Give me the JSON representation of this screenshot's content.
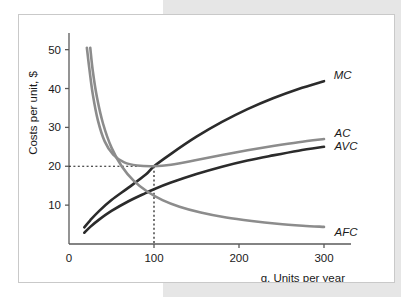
{
  "figure": {
    "background_color": "#ffffff",
    "panel_color": "#e6e6e6",
    "border_color": "#c9c9c9"
  },
  "chart_data": {
    "type": "line",
    "title": "",
    "xlabel": "q, Units per year",
    "ylabel": "Costs per unit, $",
    "xlim": [
      0,
      320
    ],
    "ylim": [
      0,
      53
    ],
    "xticks": [
      0,
      100,
      200,
      300
    ],
    "xtick_labels": [
      "0",
      "100",
      "200",
      "300"
    ],
    "yticks": [
      10,
      20,
      30,
      40,
      50
    ],
    "ytick_labels": [
      "10",
      "20",
      "30",
      "40",
      "50"
    ],
    "grid": false,
    "legend_position": "right-inline-labels",
    "annotations": [
      {
        "name": "min-ac-guideline",
        "type": "dotted-crosshair",
        "x": 100,
        "y": 20,
        "description": "Dotted lines marking minimum AC at q = 100, cost = 20"
      }
    ],
    "series": [
      {
        "name": "MC",
        "label": "MC",
        "color": "#2b2b2b",
        "width": 2.6,
        "label_x": 302,
        "label_y": 43.4,
        "x": [
          18,
          25,
          35,
          50,
          70,
          90,
          100,
          120,
          150,
          180,
          210,
          240,
          270,
          300
        ],
        "y": [
          4.3,
          6.1,
          8.4,
          11.3,
          14.5,
          17.8,
          20.0,
          23.2,
          27.6,
          31.4,
          34.7,
          37.5,
          39.9,
          41.9
        ]
      },
      {
        "name": "AC",
        "label": "AC",
        "color": "#8c8c8c",
        "width": 2.6,
        "label_x": 303,
        "label_y": 28.6,
        "x": [
          21,
          24,
          28,
          34,
          42,
          52,
          65,
          80,
          100,
          120,
          150,
          180,
          210,
          240,
          270,
          300
        ],
        "y": [
          50.5,
          45.0,
          38.5,
          31.8,
          26.4,
          23.0,
          21.0,
          20.2,
          20.0,
          20.4,
          21.6,
          22.9,
          24.1,
          25.2,
          26.2,
          27.0
        ]
      },
      {
        "name": "AVC",
        "label": "AVC",
        "color": "#2b2b2b",
        "width": 2.6,
        "label_x": 303,
        "label_y": 25.1,
        "x": [
          18,
          25,
          35,
          50,
          70,
          90,
          100,
          120,
          150,
          180,
          210,
          240,
          270,
          300
        ],
        "y": [
          2.9,
          4.4,
          6.2,
          8.5,
          11.0,
          13.1,
          14.1,
          15.8,
          18.0,
          19.9,
          21.5,
          22.8,
          24.0,
          25.0
        ]
      },
      {
        "name": "AFC",
        "label": "AFC",
        "color": "#8c8c8c",
        "width": 2.6,
        "label_x": 303,
        "label_y": 3.2,
        "x": [
          25,
          28,
          33,
          40,
          50,
          62,
          76,
          92,
          110,
          130,
          155,
          185,
          215,
          245,
          275,
          300
        ],
        "y": [
          50.5,
          44.5,
          37.6,
          31.0,
          24.8,
          20.0,
          16.3,
          13.5,
          11.3,
          9.6,
          8.1,
          6.8,
          5.9,
          5.2,
          4.7,
          4.4
        ]
      }
    ]
  }
}
